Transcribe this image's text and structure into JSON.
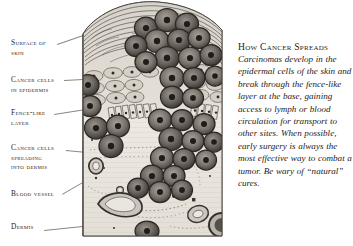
{
  "figure": {
    "labels": [
      {
        "id": "surface-of-skin",
        "lines": [
          "Surface of",
          "skin"
        ]
      },
      {
        "id": "cancer-cells-in-epidermis",
        "lines": [
          "Cancer cells",
          "in epidermis"
        ]
      },
      {
        "id": "fence-like-layer",
        "lines": [
          "Fence-like",
          "layer"
        ]
      },
      {
        "id": "cancer-cells-spreading",
        "lines": [
          "Cancer cells",
          "spreading",
          "into dermis"
        ]
      },
      {
        "id": "blood-vessel",
        "lines": [
          "Blood vessel"
        ]
      },
      {
        "id": "dermis",
        "lines": [
          "Dermis"
        ]
      }
    ]
  },
  "article": {
    "heading": "How Cancer Spreads",
    "body": "Carcinomas develop in the epidermal cells of the skin and break through the fence-like layer at the base, gaining access to lymph or blood circulation for transport to other sites. When possible, early surgery is always the most effective way to combat a tumor. Be wary of “natural” cures."
  },
  "colors": {
    "paper": "#ffffff",
    "ink": "#29241f",
    "leader": "#8d867c",
    "cell_dark": "#4a4541",
    "cell_mid": "#8d8881",
    "cell_light": "#c9c4bc",
    "dermis_bg": "#eae6df",
    "epidermis_bg": "#ded9d1"
  }
}
